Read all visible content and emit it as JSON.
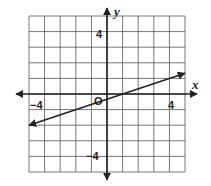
{
  "chart_data": {
    "type": "line",
    "title": "",
    "xlabel": "x",
    "ylabel": "y",
    "xlim": [
      -5,
      5
    ],
    "ylim": [
      -5,
      5
    ],
    "grid": true,
    "grid_step": 1,
    "x_tick_labels": [
      {
        "value": -4,
        "label": "−4"
      },
      {
        "value": 4,
        "label": "4"
      }
    ],
    "y_tick_labels": [
      {
        "value": 4,
        "label": "4"
      },
      {
        "value": -4,
        "label": "−4"
      }
    ],
    "origin_label": "O",
    "series": [
      {
        "name": "line",
        "equation": "y = (1/3)x - 1/3",
        "slope": 0.333,
        "y_intercept": -0.333,
        "x_intercept": 1,
        "arrows_both_ends": true,
        "x": [
          -5,
          5
        ],
        "y": [
          -2,
          1.333
        ]
      }
    ]
  },
  "labels": {
    "x_axis": "x",
    "y_axis": "y",
    "origin": "O",
    "x_neg4": "−4",
    "x_pos4": "4",
    "y_pos4": "4",
    "y_neg4": "−4"
  }
}
